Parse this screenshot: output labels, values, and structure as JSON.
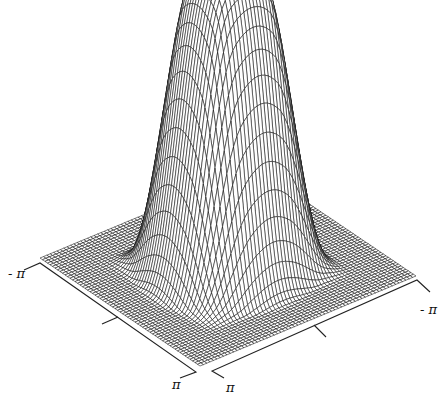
{
  "chart_data": {
    "type": "surface3d",
    "title": "",
    "x_axis": {
      "range": [
        -3.14159,
        3.14159
      ],
      "tick_labels": [
        "- π",
        "π"
      ],
      "ticks": 3
    },
    "y_axis": {
      "range": [
        -3.14159,
        3.14159
      ],
      "tick_labels": [
        "π",
        "- π"
      ],
      "ticks": 3
    },
    "z_range": [
      0,
      1
    ],
    "mesh": {
      "resolution": 64,
      "line_color": "#111111",
      "background": "#ffffff"
    },
    "surface": {
      "kind": "separable-plateau",
      "plateau_halfwidth": 0.55,
      "transition_width": 1.6,
      "peak_value": 1.0
    },
    "grid": false,
    "legend": null
  },
  "labels": {
    "left_axis_start": "- π",
    "left_axis_end": "π",
    "right_axis_start": "π",
    "right_axis_end": "- π"
  }
}
